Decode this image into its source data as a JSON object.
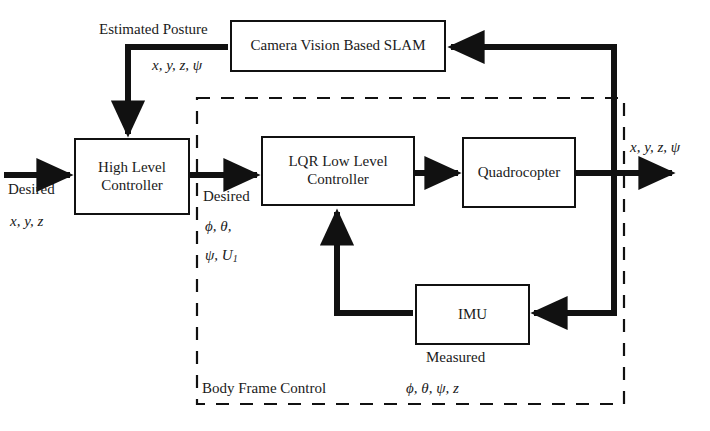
{
  "diagram": {
    "type": "block-diagram",
    "colors": {
      "line": "#111111",
      "background": "#ffffff",
      "text": "#1a1a1a",
      "dashed_boundary": "#111111"
    },
    "blocks": [
      {
        "id": "slam",
        "label": "Camera Vision Based SLAM",
        "x": 230,
        "y": 20,
        "w": 216,
        "h": 52
      },
      {
        "id": "high_level",
        "label_line1": "High Level",
        "label_line2": "Controller",
        "x": 74,
        "y": 138,
        "w": 116,
        "h": 77
      },
      {
        "id": "lqr",
        "label_line1": "LQR Low Level",
        "label_line2": "Controller",
        "x": 261,
        "y": 136,
        "w": 154,
        "h": 70
      },
      {
        "id": "quadrocopter",
        "label": "Quadrocopter",
        "x": 462,
        "y": 137,
        "w": 114,
        "h": 71
      },
      {
        "id": "imu",
        "label": "IMU",
        "x": 415,
        "y": 284,
        "w": 115,
        "h": 61
      }
    ],
    "labels": {
      "estimated_posture": "Estimated Posture",
      "estimated_posture_signals": "x, y, z, ψ",
      "desired_input": "Desired",
      "desired_input_signals": "x, y, z",
      "desired_mid": "Desired",
      "desired_mid_signals_line1": "ϕ, θ,",
      "desired_mid_signals_line2_prefix": "ψ, U",
      "desired_mid_signals_line2_sub": "1",
      "output_signals": "x, y, z, ψ",
      "measured": "Measured",
      "measured_signals": "ϕ, θ, ψ, z",
      "body_frame_control": "Body Frame Control"
    },
    "dashed_region": {
      "name": "Body Frame Control",
      "x": 197,
      "y": 98,
      "w": 427,
      "h": 306
    },
    "signal_flow": [
      {
        "from": "external-input",
        "to": "high_level",
        "signal": "Desired x, y, z"
      },
      {
        "from": "high_level",
        "to": "lqr",
        "signal": "Desired ϕ, θ, ψ, U1"
      },
      {
        "from": "lqr",
        "to": "quadrocopter",
        "signal": ""
      },
      {
        "from": "quadrocopter",
        "to": "external-output",
        "signal": "x, y, z, ψ"
      },
      {
        "from": "quadrocopter",
        "to": "slam",
        "signal": ""
      },
      {
        "from": "slam",
        "to": "high_level",
        "signal": "Estimated Posture x, y, z, ψ"
      },
      {
        "from": "quadrocopter",
        "to": "imu",
        "signal": ""
      },
      {
        "from": "imu",
        "to": "lqr",
        "signal": "Measured ϕ, θ, ψ, z"
      }
    ]
  }
}
